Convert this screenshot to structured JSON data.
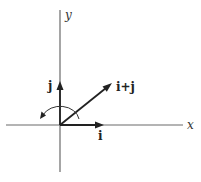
{
  "diagram": {
    "axes": {
      "x_label": "x",
      "y_label": "y"
    },
    "vectors": [
      {
        "id": "i",
        "label": "i",
        "from": [
          0,
          0
        ],
        "to": [
          1,
          0
        ]
      },
      {
        "id": "j",
        "label": "j",
        "from": [
          0,
          0
        ],
        "to": [
          0,
          1
        ]
      },
      {
        "id": "i_plus_j",
        "label": "i+j",
        "from": [
          0,
          0
        ],
        "to": [
          1,
          1
        ]
      }
    ],
    "rotation_arc": {
      "direction": "counterclockwise",
      "from": "i+j",
      "to": "past j"
    },
    "colors": {
      "axis": "#6a6a6a",
      "vector": "#222222",
      "background": "#ffffff"
    }
  }
}
